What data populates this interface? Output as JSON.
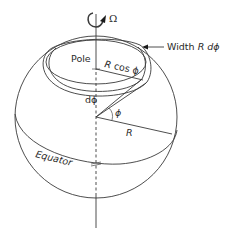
{
  "diagram": {
    "type": "rotating-sphere-latitude-band",
    "labels": {
      "rotation": "Ω",
      "width_prefix": "Width ",
      "width_R": "R",
      "width_dphi": " dϕ",
      "pole": "Pole",
      "radius_cos_R": "R",
      "radius_cos_rest": " cos ϕ",
      "dphi": "dϕ",
      "phi": "ϕ",
      "radius": "R",
      "equator": "Equator"
    },
    "colors": {
      "line": "#3a3a3a",
      "text": "#2a2a2a",
      "background": "#ffffff"
    }
  }
}
